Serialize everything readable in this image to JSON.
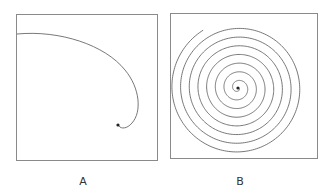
{
  "figure": {
    "panels": [
      {
        "id": "A",
        "label": "A",
        "description": "single curving arc from left edge spiraling inward to a dot"
      },
      {
        "id": "B",
        "label": "B",
        "description": "tight Archimedean spiral with many turns ending at center dot"
      }
    ],
    "colors": {
      "stroke": "#555555",
      "border": "#8a8a8a",
      "dot": "#222222"
    }
  }
}
